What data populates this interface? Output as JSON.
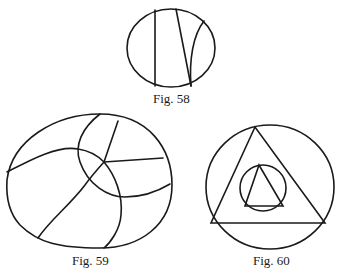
{
  "figures": [
    {
      "id": "fig58",
      "caption": "Fig. 58"
    },
    {
      "id": "fig59",
      "caption": "Fig. 59"
    },
    {
      "id": "fig60",
      "caption": "Fig. 60"
    }
  ],
  "colors": {
    "stroke": "#1a1a1a",
    "background": "#ffffff"
  }
}
